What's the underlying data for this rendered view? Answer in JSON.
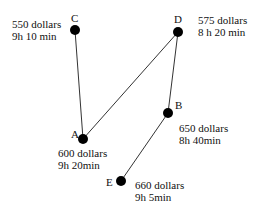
{
  "diagram": {
    "type": "graph",
    "nodes": [
      {
        "id": "A",
        "price": "600 dollars",
        "duration": "9h 20min"
      },
      {
        "id": "B",
        "price": "650 dollars",
        "duration": "8h 40min"
      },
      {
        "id": "C",
        "price": "550 dollars",
        "duration": "9h 10 min"
      },
      {
        "id": "D",
        "price": "575 dollars",
        "duration": "8 h 20 min"
      },
      {
        "id": "E",
        "price": "660 dollars",
        "duration": "9h 5min"
      }
    ],
    "edges": [
      [
        "C",
        "A"
      ],
      [
        "A",
        "D"
      ],
      [
        "D",
        "B"
      ],
      [
        "B",
        "E"
      ]
    ],
    "colors": {
      "node": "#000000",
      "edge": "#333333",
      "text": "#111111"
    }
  }
}
